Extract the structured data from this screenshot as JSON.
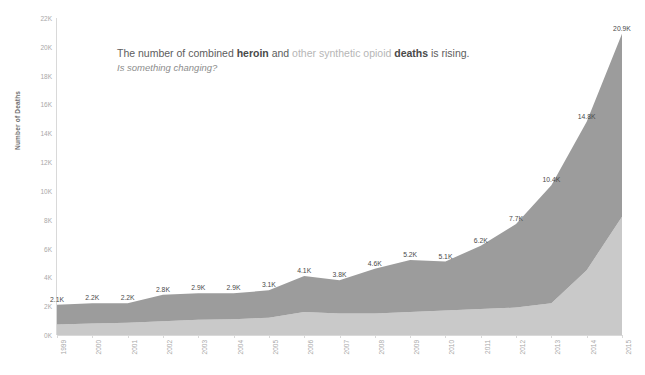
{
  "title": {
    "prefix": "The number of combined ",
    "bold1": "heroin",
    "mid": " and ",
    "muted": "other synthetic opioid",
    "bold2": " deaths",
    "suffix": " is rising.",
    "subtitle": "Is something changing?"
  },
  "colors": {
    "upper_band": "#9c9c9c",
    "lower_band": "#c9c9c9",
    "axis": "#d9d9d9",
    "tick_text": "#a8a8a8",
    "label_text": "#4a4a4a",
    "title_text": "#5d5d5d",
    "title_muted": "#b6b6b6"
  },
  "chart_data": {
    "type": "area",
    "title": "The number of combined heroin and other synthetic opioid deaths is rising.",
    "subtitle": "Is something changing?",
    "xlabel": "",
    "ylabel": "Number of Deaths",
    "ylim": [
      0,
      22000
    ],
    "grid": false,
    "legend_position": "none",
    "stacked": true,
    "categories": [
      "1999",
      "2000",
      "2001",
      "2002",
      "2003",
      "2004",
      "2005",
      "2006",
      "2007",
      "2008",
      "2009",
      "2010",
      "2011",
      "2012",
      "2013",
      "2014",
      "2015"
    ],
    "y_ticks": [
      "0K",
      "2K",
      "4K",
      "6K",
      "8K",
      "10K",
      "12K",
      "14K",
      "16K",
      "18K",
      "20K",
      "22K"
    ],
    "y_tick_values": [
      0,
      2000,
      4000,
      6000,
      8000,
      10000,
      12000,
      14000,
      16000,
      18000,
      20000,
      22000
    ],
    "series": [
      {
        "name": "heroin",
        "color": "#c9c9c9",
        "values": [
          730,
          800,
          850,
          950,
          1050,
          1100,
          1200,
          1600,
          1500,
          1500,
          1600,
          1700,
          1800,
          1900,
          2200,
          4500,
          8200
        ]
      },
      {
        "name": "other synthetic opioid",
        "color": "#9c9c9c",
        "values": [
          1370,
          1400,
          1350,
          1850,
          1850,
          1800,
          1900,
          2500,
          2300,
          3100,
          3600,
          3400,
          4400,
          5800,
          8200,
          10300,
          12700
        ]
      }
    ],
    "totals": [
      2100,
      2200,
      2200,
      2800,
      2900,
      2900,
      3100,
      4100,
      3800,
      4600,
      5200,
      5100,
      6200,
      7700,
      10400,
      14800,
      20900
    ],
    "total_labels": [
      "2.1K",
      "2.2K",
      "2.2K",
      "2.8K",
      "2.9K",
      "2.9K",
      "3.1K",
      "4.1K",
      "3.8K",
      "4.6K",
      "5.2K",
      "5.1K",
      "6.2K",
      "7.7K",
      "10.4K",
      "14.8K",
      "20.9K"
    ]
  }
}
